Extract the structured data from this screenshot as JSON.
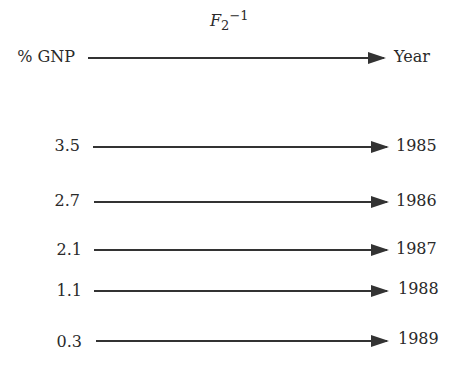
{
  "mapping": {
    "function_name": "F",
    "function_subscript": "2",
    "function_superscript": "−1",
    "domain_label": "% GNP",
    "codomain_label": "Year"
  },
  "rows": [
    {
      "gnp": "3.5",
      "year": "1985"
    },
    {
      "gnp": "2.7",
      "year": "1986"
    },
    {
      "gnp": "2.1",
      "year": "1987"
    },
    {
      "gnp": "1.1",
      "year": "1988"
    },
    {
      "gnp": "0.3",
      "year": "1989"
    }
  ]
}
